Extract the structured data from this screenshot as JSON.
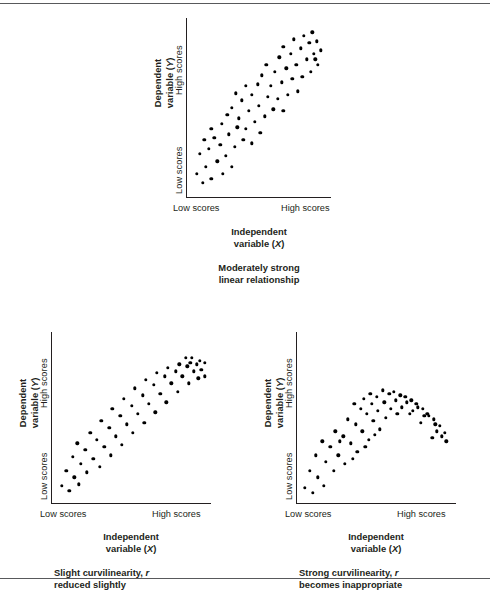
{
  "figure": {
    "axis_labels": {
      "y_high": "High scores",
      "y_low": "Low scores",
      "x_low": "Low scores",
      "x_high": "High scores",
      "y_title_line1": "Dependent",
      "y_title_line2": "variable (Y)",
      "y_title_symbol": "Y",
      "x_title_line1": "Independent",
      "x_title_line2": "variable (X)",
      "x_title_symbol": "X"
    },
    "colors": {
      "ink": "#231f20",
      "dot": "#000000",
      "rule": "#58595b",
      "background": "#ffffff"
    }
  },
  "chart_data": [
    {
      "id": "panel-top",
      "type": "scatter",
      "title": "",
      "caption_line1": "Moderately strong",
      "caption_line2": "linear relationship",
      "xlabel": "Independent variable (X)",
      "ylabel": "Dependent variable (Y)",
      "xtick_labels": [
        "Low scores",
        "High scores"
      ],
      "ytick_labels": [
        "Low scores",
        "High scores"
      ],
      "xlim": [
        0,
        100
      ],
      "ylim": [
        0,
        100
      ],
      "grid": false,
      "legend": "none",
      "relationship": "positive linear, moderately strong",
      "points": [
        [
          7,
          13
        ],
        [
          11,
          8
        ],
        [
          13,
          17
        ],
        [
          17,
          10
        ],
        [
          9,
          24
        ],
        [
          15,
          27
        ],
        [
          21,
          20
        ],
        [
          25,
          13
        ],
        [
          19,
          33
        ],
        [
          23,
          29
        ],
        [
          27,
          23
        ],
        [
          31,
          17
        ],
        [
          12,
          32
        ],
        [
          17,
          38
        ],
        [
          29,
          35
        ],
        [
          33,
          28
        ],
        [
          24,
          41
        ],
        [
          28,
          46
        ],
        [
          35,
          39
        ],
        [
          39,
          32
        ],
        [
          31,
          50
        ],
        [
          36,
          44
        ],
        [
          41,
          38
        ],
        [
          45,
          30
        ],
        [
          38,
          54
        ],
        [
          43,
          48
        ],
        [
          47,
          42
        ],
        [
          51,
          36
        ],
        [
          34,
          58
        ],
        [
          45,
          57
        ],
        [
          50,
          51
        ],
        [
          54,
          45
        ],
        [
          41,
          62
        ],
        [
          49,
          63
        ],
        [
          56,
          56
        ],
        [
          60,
          49
        ],
        [
          52,
          68
        ],
        [
          58,
          62
        ],
        [
          63,
          55
        ],
        [
          67,
          48
        ],
        [
          55,
          74
        ],
        [
          61,
          70
        ],
        [
          66,
          64
        ],
        [
          70,
          57
        ],
        [
          64,
          78
        ],
        [
          69,
          72
        ],
        [
          73,
          66
        ],
        [
          77,
          59
        ],
        [
          67,
          84
        ],
        [
          72,
          80
        ],
        [
          76,
          74
        ],
        [
          80,
          67
        ],
        [
          74,
          88
        ],
        [
          79,
          83
        ],
        [
          83,
          77
        ],
        [
          86,
          70
        ],
        [
          81,
          90
        ],
        [
          85,
          86
        ],
        [
          88,
          80
        ],
        [
          91,
          74
        ],
        [
          87,
          92
        ],
        [
          90,
          87
        ],
        [
          93,
          82
        ],
        [
          89,
          77
        ]
      ]
    },
    {
      "id": "panel-bottom-left",
      "type": "scatter",
      "title": "",
      "caption_line1": "Slight curvilinearity, r",
      "caption_line2": "reduced slightly",
      "caption_symbol": "r",
      "xlabel": "Independent variable (X)",
      "ylabel": "Dependent variable (Y)",
      "xtick_labels": [
        "Low scores",
        "High scores"
      ],
      "ytick_labels": [
        "Low scores",
        "High scores"
      ],
      "xlim": [
        0,
        100
      ],
      "ylim": [
        0,
        100
      ],
      "grid": false,
      "legend": "none",
      "relationship": "positive monotonic, decelerating (logarithmic), slight curvilinearity",
      "points": [
        [
          6,
          10
        ],
        [
          11,
          7
        ],
        [
          9,
          19
        ],
        [
          14,
          15
        ],
        [
          17,
          11
        ],
        [
          13,
          27
        ],
        [
          18,
          23
        ],
        [
          22,
          18
        ],
        [
          16,
          35
        ],
        [
          21,
          31
        ],
        [
          26,
          26
        ],
        [
          30,
          21
        ],
        [
          24,
          41
        ],
        [
          28,
          37
        ],
        [
          33,
          33
        ],
        [
          37,
          28
        ],
        [
          31,
          48
        ],
        [
          36,
          44
        ],
        [
          40,
          39
        ],
        [
          44,
          34
        ],
        [
          38,
          55
        ],
        [
          43,
          51
        ],
        [
          47,
          46
        ],
        [
          51,
          41
        ],
        [
          45,
          61
        ],
        [
          50,
          57
        ],
        [
          54,
          52
        ],
        [
          58,
          47
        ],
        [
          52,
          67
        ],
        [
          57,
          63
        ],
        [
          61,
          58
        ],
        [
          65,
          53
        ],
        [
          59,
          72
        ],
        [
          64,
          69
        ],
        [
          68,
          64
        ],
        [
          72,
          59
        ],
        [
          66,
          76
        ],
        [
          71,
          74
        ],
        [
          75,
          70
        ],
        [
          79,
          65
        ],
        [
          73,
          79
        ],
        [
          78,
          77
        ],
        [
          82,
          74
        ],
        [
          86,
          70
        ],
        [
          80,
          81
        ],
        [
          85,
          80
        ],
        [
          89,
          77
        ],
        [
          92,
          73
        ],
        [
          87,
          82
        ],
        [
          91,
          81
        ],
        [
          94,
          78
        ],
        [
          96,
          74
        ],
        [
          93,
          83
        ],
        [
          96,
          82
        ],
        [
          84,
          85
        ],
        [
          88,
          85
        ]
      ]
    },
    {
      "id": "panel-bottom-right",
      "type": "scatter",
      "title": "",
      "caption_line1": "Strong curvilinearity, r",
      "caption_line2": "becomes inappropriate",
      "caption_symbol": "r",
      "xlabel": "Independent variable (X)",
      "ylabel": "Dependent variable (Y)",
      "xtick_labels": [
        "Low scores",
        "High scores"
      ],
      "ytick_labels": [
        "Low scores",
        "High scores"
      ],
      "xlim": [
        0,
        100
      ],
      "ylim": [
        0,
        100
      ],
      "grid": false,
      "legend": "none",
      "relationship": "inverted-U quadratic, strong curvilinearity",
      "points": [
        [
          5,
          9
        ],
        [
          10,
          6
        ],
        [
          8,
          19
        ],
        [
          13,
          15
        ],
        [
          17,
          10
        ],
        [
          12,
          28
        ],
        [
          18,
          24
        ],
        [
          23,
          19
        ],
        [
          16,
          36
        ],
        [
          21,
          33
        ],
        [
          26,
          28
        ],
        [
          30,
          23
        ],
        [
          24,
          42
        ],
        [
          29,
          39
        ],
        [
          34,
          35
        ],
        [
          38,
          30
        ],
        [
          32,
          49
        ],
        [
          37,
          46
        ],
        [
          41,
          42
        ],
        [
          45,
          37
        ],
        [
          40,
          55
        ],
        [
          44,
          52
        ],
        [
          48,
          48
        ],
        [
          52,
          43
        ],
        [
          36,
          58
        ],
        [
          42,
          61
        ],
        [
          47,
          58
        ],
        [
          51,
          54
        ],
        [
          46,
          64
        ],
        [
          50,
          62
        ],
        [
          55,
          59
        ],
        [
          59,
          55
        ],
        [
          54,
          66
        ],
        [
          58,
          64
        ],
        [
          62,
          60
        ],
        [
          66,
          56
        ],
        [
          61,
          65
        ],
        [
          65,
          63
        ],
        [
          69,
          59
        ],
        [
          73,
          54
        ],
        [
          68,
          62
        ],
        [
          72,
          60
        ],
        [
          76,
          56
        ],
        [
          80,
          51
        ],
        [
          75,
          58
        ],
        [
          79,
          55
        ],
        [
          83,
          51
        ],
        [
          87,
          46
        ],
        [
          82,
          52
        ],
        [
          86,
          49
        ],
        [
          90,
          45
        ],
        [
          93,
          41
        ],
        [
          88,
          42
        ],
        [
          91,
          39
        ],
        [
          94,
          36
        ],
        [
          85,
          38
        ],
        [
          78,
          47
        ],
        [
          71,
          52
        ],
        [
          63,
          52
        ],
        [
          56,
          50
        ],
        [
          49,
          40
        ],
        [
          43,
          33
        ],
        [
          35,
          26
        ],
        [
          27,
          36
        ]
      ]
    }
  ]
}
